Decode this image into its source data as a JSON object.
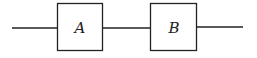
{
  "diagram": {
    "type": "block-diagram-series",
    "blocks": [
      {
        "label": "A"
      },
      {
        "label": "B"
      }
    ],
    "stroke_color": "#222222",
    "background": "#ffffff"
  }
}
